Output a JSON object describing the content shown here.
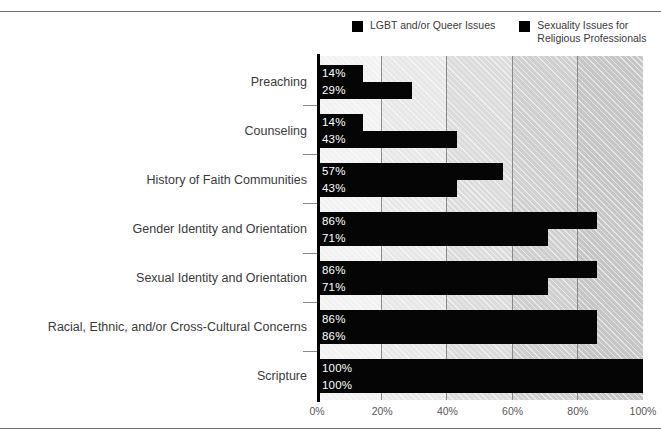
{
  "chart_data": {
    "type": "bar",
    "orientation": "horizontal",
    "title": "",
    "subtitle": "",
    "xlabel": "",
    "ylabel": "",
    "xlim": [
      0,
      100
    ],
    "grid": true,
    "legend_position": "top-right",
    "categories": [
      "Preaching",
      "Counseling",
      "History of Faith Communities",
      "Gender Identity and Orientation",
      "Sexual Identity and Orientation",
      "Racial, Ethnic, and/or Cross-Cultural Concerns",
      "Scripture"
    ],
    "series": [
      {
        "name": "LGBT and/or Queer Issues",
        "color": "#050505",
        "values": [
          14,
          14,
          57,
          86,
          86,
          86,
          100
        ],
        "labels": [
          "14%",
          "14%",
          "57%",
          "86%",
          "86%",
          "86%",
          "100%"
        ]
      },
      {
        "name": "Sexuality Issues for Religious Professionals",
        "color": "#050505",
        "values": [
          29,
          43,
          43,
          71,
          71,
          86,
          100
        ],
        "labels": [
          "29%",
          "43%",
          "43%",
          "71%",
          "71%",
          "86%",
          "100%"
        ]
      }
    ],
    "xticks": [
      0,
      20,
      40,
      60,
      80,
      100
    ],
    "xtick_labels": [
      "0%",
      "20%",
      "40%",
      "60%",
      "80%",
      "100%"
    ],
    "plot_bands": [
      "#f2f2f2",
      "#e8e8e8",
      "#dcdcdc",
      "#cfcfcf",
      "#c6c6c6"
    ]
  },
  "legend": {
    "entries": [
      {
        "label": "LGBT and/or Queer Issues",
        "swatch": "legend-swatch-icon"
      },
      {
        "label": "Sexuality Issues for\nReligious Professionals",
        "swatch": "legend-swatch-icon"
      }
    ]
  }
}
